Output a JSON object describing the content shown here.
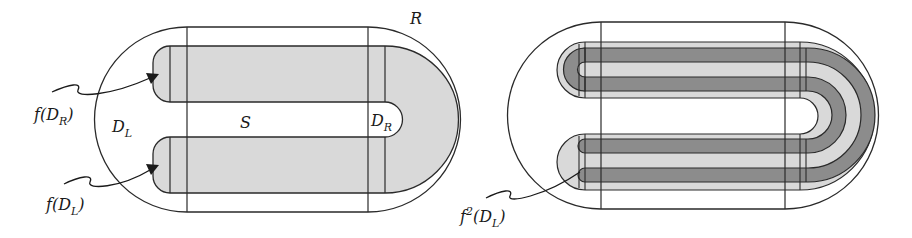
{
  "figure": {
    "left_panel": {
      "labels": {
        "R": "R",
        "S": "S",
        "D_L_base": "D",
        "D_L_sub": "L",
        "D_R_base": "D",
        "D_R_sub": "R",
        "f_D_R_prefix": "f(D",
        "f_D_R_sub": "R",
        "f_D_R_suffix": ")",
        "f_D_L_prefix": "f(D",
        "f_D_L_sub": "L",
        "f_D_L_suffix": ")"
      }
    },
    "right_panel": {
      "labels": {
        "f2_prefix": "f",
        "f2_sup": "2",
        "f2_mid": "(D",
        "f2_sub": "L",
        "f2_suffix": ")"
      }
    },
    "colors": {
      "stroke": "#2a2a2a",
      "light_fill": "#d9d9d9",
      "dark_fill": "#8c8c8c",
      "background": "#ffffff"
    }
  }
}
